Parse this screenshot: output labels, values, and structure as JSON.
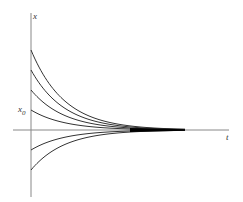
{
  "chart_data": {
    "type": "line",
    "title": "",
    "xlabel": "t",
    "ylabel": "x",
    "ytick_label": "x0",
    "grid": false,
    "legend": null,
    "series": [
      {
        "name": "curve-1",
        "x0": 4,
        "decay": "exponential to 0"
      },
      {
        "name": "curve-2",
        "x0": 3,
        "decay": "exponential to 0"
      },
      {
        "name": "curve-3",
        "x0": 2,
        "decay": "exponential to 0"
      },
      {
        "name": "curve-4 (x0)",
        "x0": 1,
        "decay": "exponential to 0"
      },
      {
        "name": "curve-5",
        "x0": -1,
        "decay": "exponential to 0"
      },
      {
        "name": "curve-6",
        "x0": -2,
        "decay": "exponential to 0"
      }
    ],
    "color": "#333333"
  },
  "labels": {
    "y_axis": "x",
    "x_axis": "t",
    "x0_main": "x",
    "x0_sub": "0"
  }
}
